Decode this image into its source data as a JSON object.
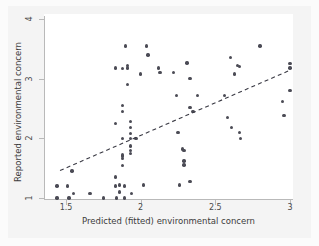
{
  "chart_data": {
    "type": "scatter",
    "title": "",
    "xlabel": "Predicted (fitted) environmental concern",
    "ylabel": "Reported environmental concern",
    "xlim": [
      1.42,
      3.02
    ],
    "ylim": [
      0.95,
      4.05
    ],
    "xticks": [
      1.5,
      2,
      2.5,
      3
    ],
    "xticklabels": [
      "1.5",
      "2",
      "2.5",
      "3"
    ],
    "yticks": [
      1,
      2,
      3,
      4
    ],
    "yticklabels": [
      "1",
      "2",
      "3",
      "4"
    ],
    "grid": false,
    "legend": null,
    "marker": {
      "shape": "circle",
      "color": "#4b4b55",
      "size_px": 3.4
    },
    "points": [
      [
        1.44,
        1.2
      ],
      [
        1.44,
        1.0
      ],
      [
        1.51,
        1.2
      ],
      [
        1.52,
        1.0
      ],
      [
        1.54,
        1.45
      ],
      [
        1.55,
        1.08
      ],
      [
        1.66,
        1.08
      ],
      [
        1.75,
        1.0
      ],
      [
        1.83,
        3.18
      ],
      [
        1.83,
        2.25
      ],
      [
        1.83,
        1.35
      ],
      [
        1.83,
        1.2
      ],
      [
        1.84,
        1.0
      ],
      [
        1.86,
        1.22
      ],
      [
        1.86,
        1.1
      ],
      [
        1.88,
        3.17
      ],
      [
        1.88,
        2.55
      ],
      [
        1.88,
        2.45
      ],
      [
        1.88,
        2.0
      ],
      [
        1.88,
        1.72
      ],
      [
        1.88,
        1.7
      ],
      [
        1.88,
        1.66
      ],
      [
        1.88,
        1.54
      ],
      [
        1.89,
        1.2
      ],
      [
        1.89,
        1.0
      ],
      [
        1.9,
        3.55
      ],
      [
        1.91,
        3.22
      ],
      [
        1.91,
        3.18
      ],
      [
        1.91,
        2.9
      ],
      [
        1.93,
        2.28
      ],
      [
        1.93,
        2.18
      ],
      [
        1.93,
        2.08
      ],
      [
        1.93,
        2.0
      ],
      [
        1.93,
        1.87
      ],
      [
        1.93,
        1.8
      ],
      [
        1.93,
        1.75
      ],
      [
        1.94,
        1.08
      ],
      [
        1.97,
        2.0
      ],
      [
        2.0,
        3.08
      ],
      [
        2.02,
        1.22
      ],
      [
        2.04,
        3.55
      ],
      [
        2.05,
        3.4
      ],
      [
        2.12,
        3.18
      ],
      [
        2.13,
        3.1
      ],
      [
        2.22,
        3.1
      ],
      [
        2.24,
        2.72
      ],
      [
        2.25,
        2.1
      ],
      [
        2.26,
        1.22
      ],
      [
        2.28,
        1.82
      ],
      [
        2.29,
        1.8
      ],
      [
        2.29,
        1.62
      ],
      [
        2.29,
        1.55
      ],
      [
        2.31,
        3.26
      ],
      [
        2.33,
        3.0
      ],
      [
        2.33,
        2.52
      ],
      [
        2.33,
        1.28
      ],
      [
        2.35,
        2.45
      ],
      [
        2.38,
        2.72
      ],
      [
        2.56,
        2.72
      ],
      [
        2.58,
        2.35
      ],
      [
        2.6,
        3.35
      ],
      [
        2.61,
        2.18
      ],
      [
        2.63,
        3.08
      ],
      [
        2.65,
        3.22
      ],
      [
        2.66,
        3.2
      ],
      [
        2.66,
        2.1
      ],
      [
        2.67,
        2.0
      ],
      [
        2.8,
        3.55
      ],
      [
        2.95,
        2.62
      ],
      [
        2.96,
        2.38
      ],
      [
        3.0,
        3.25
      ],
      [
        3.0,
        3.18
      ],
      [
        3.0,
        2.8
      ]
    ],
    "fit_line": {
      "style": "dashed",
      "color": "#3a3a44",
      "x1": 1.46,
      "y1": 1.46,
      "x2": 2.99,
      "y2": 3.13
    }
  },
  "axes": {
    "y_title": "Reported environmental concern",
    "x_title": "Predicted (fitted) environmental concern",
    "y_labels": [
      "1",
      "2",
      "3",
      "4"
    ],
    "x_labels": [
      "1.5",
      "2",
      "2.5",
      "3"
    ]
  }
}
